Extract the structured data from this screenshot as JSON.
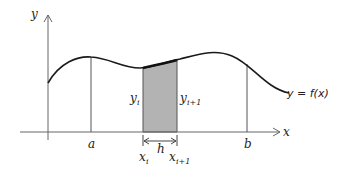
{
  "diagram": {
    "axes": {
      "x_label": "x",
      "y_label": "y"
    },
    "curve_label": "y = f(x)",
    "bounds": {
      "a_label": "a",
      "b_label": "b"
    },
    "strip": {
      "left_height_label": "y",
      "left_height_sub": "i",
      "right_height_label": "y",
      "right_height_sub": "i+1",
      "width_label": "h",
      "left_x_label": "x",
      "left_x_sub": "i",
      "right_x_label": "x",
      "right_x_sub": "i+1",
      "fill_color": "#b3b3b3"
    },
    "colors": {
      "curve": "#1a1a1a",
      "axis": "#555555",
      "background": "#ffffff"
    }
  }
}
